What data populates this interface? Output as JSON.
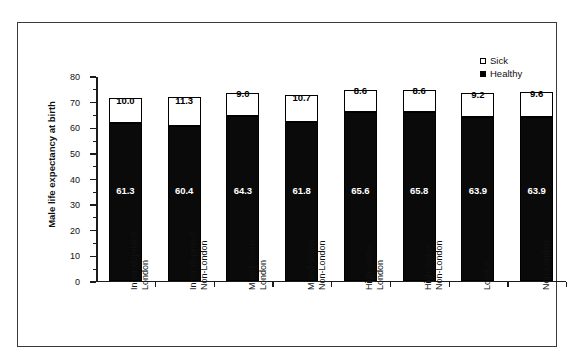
{
  "artifact_text": "",
  "chart_data": {
    "type": "bar",
    "subtype": "stacked-column",
    "title": "",
    "xlabel": "",
    "ylabel": "Male life expectancy at birth",
    "ylim": [
      0,
      80
    ],
    "ytick_step": 10,
    "yticks": [
      0,
      10,
      20,
      30,
      40,
      50,
      60,
      70,
      80
    ],
    "ytick_labels": [
      "0",
      "10",
      "20",
      "30",
      "40",
      "50",
      "60",
      "70",
      "80"
    ],
    "grid": false,
    "legend_position": "top-right",
    "categories": [
      "Inner-deprived London",
      "Inner-deprived Non-London",
      "Mixed-status London",
      "Mixed-status Non-London",
      "High-status London",
      "High-status Non-London",
      "London",
      "Non-London"
    ],
    "category_lines": [
      [
        "Inner-deprived",
        "London"
      ],
      [
        "Inner-deprived",
        "Non-London"
      ],
      [
        "Mixed-status",
        "London"
      ],
      [
        "Mixed-status",
        "Non-London"
      ],
      [
        "High-status",
        "London"
      ],
      [
        "High-status",
        "Non-London"
      ],
      [
        "London",
        ""
      ],
      [
        "Non-London",
        ""
      ]
    ],
    "series": [
      {
        "name": "Healthy",
        "color": "#000000",
        "values": [
          61.3,
          60.4,
          64.3,
          61.8,
          65.6,
          65.8,
          63.9,
          63.9
        ],
        "labels": [
          "61.3",
          "60.4",
          "64.3",
          "61.8",
          "65.6",
          "65.8",
          "63.9",
          "63.9"
        ]
      },
      {
        "name": "Sick",
        "color": "#ffffff",
        "values": [
          10.0,
          11.3,
          9.0,
          10.7,
          8.6,
          8.6,
          9.2,
          9.6
        ],
        "labels": [
          "10.0",
          "11.3",
          "9.0",
          "10.7",
          "8.6",
          "8.6",
          "9.2",
          "9.6"
        ]
      }
    ],
    "totals": [
      71.3,
      71.7,
      73.3,
      72.5,
      74.2,
      74.4,
      73.1,
      73.5
    ]
  },
  "legend": {
    "items": [
      {
        "label": "Sick",
        "marker": "hollow-square"
      },
      {
        "label": "Healthy",
        "marker": "filled-square"
      }
    ]
  }
}
